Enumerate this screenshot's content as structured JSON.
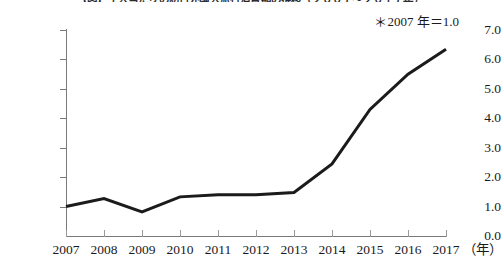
{
  "chart_data": {
    "type": "line",
    "title": "【図】１人当たりの訪日外国人旅行消費額の推移（２００７〜２０１７年）",
    "subtitle": "",
    "annotation": "＊2007 年＝1.0",
    "annotation_symbol": "＊",
    "annotation_text": "2007 年＝1.0",
    "xlabel": "",
    "x_unit": "（年）",
    "ylabel": "",
    "categories": [
      "2007",
      "2008",
      "2009",
      "2010",
      "2011",
      "2012",
      "2013",
      "2014",
      "2015",
      "2016",
      "2017"
    ],
    "x": [
      2007,
      2008,
      2009,
      2010,
      2011,
      2012,
      2013,
      2014,
      2015,
      2016,
      2017
    ],
    "values": [
      1.0,
      1.27,
      0.82,
      1.33,
      1.4,
      1.4,
      1.48,
      2.45,
      4.3,
      5.5,
      6.35
    ],
    "series": [
      {
        "name": "index",
        "values": [
          1.0,
          1.27,
          0.82,
          1.33,
          1.4,
          1.4,
          1.48,
          2.45,
          4.3,
          5.5,
          6.35
        ]
      }
    ],
    "ylim": [
      0.0,
      7.0
    ],
    "xlim": [
      2007,
      2017
    ],
    "y_ticks": [
      0.0,
      1.0,
      2.0,
      3.0,
      4.0,
      5.0,
      6.0,
      7.0
    ],
    "y_tick_labels": [
      "0.0",
      "1.0",
      "2.0",
      "3.0",
      "4.0",
      "5.0",
      "6.0",
      "7.0"
    ],
    "grid": false,
    "legend": false,
    "legend_position": "none",
    "line_color": "#1b1b1b",
    "line_width": 3,
    "markers": false
  }
}
